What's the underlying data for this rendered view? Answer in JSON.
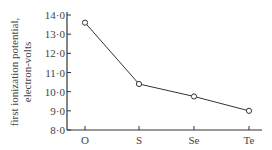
{
  "chart_data": {
    "type": "line",
    "title": "",
    "xlabel": "",
    "ylabel": "first ionization potential, electron-volts",
    "ylabel_lines": [
      "first ionization potential,",
      "electron-volts"
    ],
    "categories": [
      "O",
      "S",
      "Se",
      "Te"
    ],
    "series": [
      {
        "name": "first ionization potential",
        "values": [
          13.6,
          10.4,
          9.75,
          9.0
        ]
      }
    ],
    "ylim": [
      8.0,
      14.0
    ],
    "yticks": [
      "8·0",
      "9·0",
      "10·0",
      "11·0",
      "12·0",
      "13·0",
      "14·0"
    ],
    "ytick_values": [
      8,
      9,
      10,
      11,
      12,
      13,
      14
    ],
    "grid": false,
    "legend": "none",
    "marker": "open-circle",
    "line_color": "#333333"
  }
}
